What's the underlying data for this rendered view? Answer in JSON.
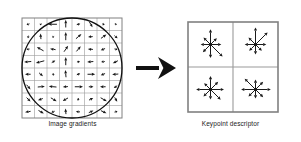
{
  "figure": {
    "background_color": "#ffffff",
    "width": 301,
    "height": 142
  },
  "left_panel": {
    "caption": "Image gradients",
    "grid": {
      "rows": 8,
      "cols": 8,
      "x": 22,
      "y": 18,
      "size": 100,
      "cell_size": 12.5,
      "line_color": "#9a9a9a",
      "border_color": "#808080",
      "line_width": 0.6
    },
    "gaussian_window": {
      "shape": "circle",
      "cx": 72,
      "cy": 68,
      "r": 50,
      "stroke_color": "#111111",
      "stroke_width": 1.3
    },
    "gradient_arrow_color": "#1a1a1a",
    "gradients": [
      {
        "col": 0,
        "row": 0,
        "angle": 200,
        "mag": 0.3
      },
      {
        "col": 1,
        "row": 0,
        "angle": 240,
        "mag": 0.2
      },
      {
        "col": 2,
        "row": 0,
        "angle": 180,
        "mag": 0.85
      },
      {
        "col": 3,
        "row": 0,
        "angle": 90,
        "mag": 0.75
      },
      {
        "col": 4,
        "row": 0,
        "angle": 15,
        "mag": 0.35
      },
      {
        "col": 5,
        "row": 0,
        "angle": 300,
        "mag": 0.6
      },
      {
        "col": 6,
        "row": 0,
        "angle": 340,
        "mag": 0.25
      },
      {
        "col": 7,
        "row": 0,
        "angle": 160,
        "mag": 0.2
      },
      {
        "col": 0,
        "row": 1,
        "angle": 260,
        "mag": 0.25
      },
      {
        "col": 1,
        "row": 1,
        "angle": 95,
        "mag": 0.55
      },
      {
        "col": 2,
        "row": 1,
        "angle": 200,
        "mag": 0.2
      },
      {
        "col": 3,
        "row": 1,
        "angle": 90,
        "mag": 0.8
      },
      {
        "col": 4,
        "row": 1,
        "angle": 40,
        "mag": 0.7
      },
      {
        "col": 5,
        "row": 1,
        "angle": 185,
        "mag": 0.45
      },
      {
        "col": 6,
        "row": 1,
        "angle": 35,
        "mag": 0.65
      },
      {
        "col": 7,
        "row": 1,
        "angle": 320,
        "mag": 0.4
      },
      {
        "col": 0,
        "row": 2,
        "angle": 190,
        "mag": 0.3
      },
      {
        "col": 1,
        "row": 2,
        "angle": 150,
        "mag": 0.75
      },
      {
        "col": 2,
        "row": 2,
        "angle": 170,
        "mag": 0.55
      },
      {
        "col": 3,
        "row": 2,
        "angle": 55,
        "mag": 0.7
      },
      {
        "col": 4,
        "row": 2,
        "angle": 50,
        "mag": 0.65
      },
      {
        "col": 5,
        "row": 2,
        "angle": 175,
        "mag": 0.5
      },
      {
        "col": 6,
        "row": 2,
        "angle": 200,
        "mag": 0.45
      },
      {
        "col": 7,
        "row": 2,
        "angle": 345,
        "mag": 0.3
      },
      {
        "col": 0,
        "row": 3,
        "angle": 185,
        "mag": 0.7
      },
      {
        "col": 1,
        "row": 3,
        "angle": 195,
        "mag": 0.85
      },
      {
        "col": 2,
        "row": 3,
        "angle": 30,
        "mag": 0.4
      },
      {
        "col": 3,
        "row": 3,
        "angle": 90,
        "mag": 0.8
      },
      {
        "col": 4,
        "row": 3,
        "angle": 10,
        "mag": 0.3
      },
      {
        "col": 5,
        "row": 3,
        "angle": 185,
        "mag": 0.6
      },
      {
        "col": 6,
        "row": 3,
        "angle": 190,
        "mag": 0.35
      },
      {
        "col": 7,
        "row": 3,
        "angle": 205,
        "mag": 0.55
      },
      {
        "col": 0,
        "row": 4,
        "angle": 180,
        "mag": 0.55
      },
      {
        "col": 1,
        "row": 4,
        "angle": 320,
        "mag": 0.5
      },
      {
        "col": 2,
        "row": 4,
        "angle": 275,
        "mag": 0.25
      },
      {
        "col": 3,
        "row": 4,
        "angle": 95,
        "mag": 0.7
      },
      {
        "col": 4,
        "row": 4,
        "angle": 20,
        "mag": 0.35
      },
      {
        "col": 5,
        "row": 4,
        "angle": 0,
        "mag": 0.75
      },
      {
        "col": 6,
        "row": 4,
        "angle": 200,
        "mag": 0.45
      },
      {
        "col": 7,
        "row": 4,
        "angle": 185,
        "mag": 0.6
      },
      {
        "col": 0,
        "row": 5,
        "angle": 310,
        "mag": 0.6
      },
      {
        "col": 1,
        "row": 5,
        "angle": 5,
        "mag": 0.7
      },
      {
        "col": 2,
        "row": 5,
        "angle": 175,
        "mag": 0.75
      },
      {
        "col": 3,
        "row": 5,
        "angle": 185,
        "mag": 0.5
      },
      {
        "col": 4,
        "row": 5,
        "angle": 0,
        "mag": 0.8
      },
      {
        "col": 5,
        "row": 5,
        "angle": 0,
        "mag": 0.45
      },
      {
        "col": 6,
        "row": 5,
        "angle": 180,
        "mag": 0.55
      },
      {
        "col": 7,
        "row": 5,
        "angle": 215,
        "mag": 0.4
      },
      {
        "col": 0,
        "row": 6,
        "angle": 315,
        "mag": 0.55
      },
      {
        "col": 1,
        "row": 6,
        "angle": 200,
        "mag": 0.5
      },
      {
        "col": 2,
        "row": 6,
        "angle": 330,
        "mag": 0.65
      },
      {
        "col": 3,
        "row": 6,
        "angle": 210,
        "mag": 0.6
      },
      {
        "col": 4,
        "row": 6,
        "angle": 250,
        "mag": 0.25
      },
      {
        "col": 5,
        "row": 6,
        "angle": 25,
        "mag": 0.45
      },
      {
        "col": 6,
        "row": 6,
        "angle": 330,
        "mag": 0.7
      },
      {
        "col": 7,
        "row": 6,
        "angle": 300,
        "mag": 0.5
      },
      {
        "col": 0,
        "row": 7,
        "angle": 190,
        "mag": 0.55
      },
      {
        "col": 1,
        "row": 7,
        "angle": 330,
        "mag": 0.6
      },
      {
        "col": 2,
        "row": 7,
        "angle": 200,
        "mag": 0.35
      },
      {
        "col": 3,
        "row": 7,
        "angle": 95,
        "mag": 0.55
      },
      {
        "col": 4,
        "row": 7,
        "angle": 175,
        "mag": 0.4
      },
      {
        "col": 5,
        "row": 7,
        "angle": 25,
        "mag": 0.5
      },
      {
        "col": 6,
        "row": 7,
        "angle": 335,
        "mag": 0.6
      },
      {
        "col": 7,
        "row": 7,
        "angle": 15,
        "mag": 0.3
      }
    ]
  },
  "transform_arrow": {
    "label": "maps-to-arrow",
    "x1": 136,
    "y1": 68,
    "x2": 176,
    "y2": 68,
    "color": "#111111",
    "shaft_width": 4,
    "head_length": 18,
    "head_width": 22
  },
  "right_panel": {
    "caption": "Keypoint descriptor",
    "grid": {
      "rows": 2,
      "cols": 2,
      "x": 188,
      "y": 22,
      "size": 90,
      "cell_size": 45,
      "line_color": "#9a9a9a",
      "border_color": "#808080",
      "line_width": 1.1
    },
    "histogram_bins": 8,
    "bin_angles": [
      0,
      45,
      90,
      135,
      180,
      225,
      270,
      315
    ],
    "arrow_color": "#1a1a1a",
    "cells": [
      {
        "name": "descriptor-cell-top-left",
        "col": 0,
        "row": 0,
        "magnitudes": [
          0.6,
          0.5,
          0.85,
          0.55,
          0.55,
          0.6,
          0.75,
          0.95
        ]
      },
      {
        "name": "descriptor-cell-top-right",
        "col": 1,
        "row": 0,
        "magnitudes": [
          0.6,
          0.95,
          0.95,
          0.55,
          0.6,
          0.5,
          0.55,
          0.5
        ]
      },
      {
        "name": "descriptor-cell-bottom-left",
        "col": 0,
        "row": 1,
        "magnitudes": [
          0.75,
          0.6,
          0.75,
          0.5,
          0.8,
          0.55,
          0.55,
          0.8
        ]
      },
      {
        "name": "descriptor-cell-bottom-right",
        "col": 1,
        "row": 1,
        "magnitudes": [
          0.85,
          0.6,
          0.55,
          0.85,
          0.8,
          0.55,
          0.5,
          0.6
        ]
      }
    ]
  }
}
